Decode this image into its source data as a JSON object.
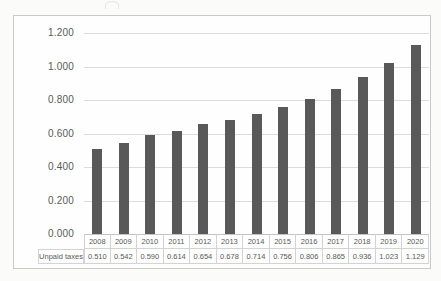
{
  "page": {
    "background_color": "#fbfbf9",
    "frame_border_color": "#c9c9c9"
  },
  "chart_data": {
    "type": "bar",
    "title": "",
    "xlabel": "",
    "ylabel": "",
    "categories": [
      "2008",
      "2009",
      "2010",
      "2011",
      "2012",
      "2013",
      "2014",
      "2015",
      "2016",
      "2017",
      "2018",
      "2019",
      "2020"
    ],
    "series": [
      {
        "name": "Unpaid taxes",
        "values": [
          0.51,
          0.542,
          0.59,
          0.614,
          0.654,
          0.678,
          0.714,
          0.756,
          0.806,
          0.865,
          0.936,
          1.023,
          1.129
        ]
      }
    ],
    "value_decimals": 3,
    "ylim": [
      0,
      1.2
    ],
    "ytick_step": 0.2,
    "ytick_labels": [
      "0.000",
      "0.200",
      "0.400",
      "0.600",
      "0.800",
      "1.000",
      "1.200"
    ],
    "grid": true,
    "legend_position": "data-table-row",
    "bar_color": "#595959",
    "gridline_color": "#dcdcdc",
    "axis_text_color": "#595959",
    "table_border_color": "#d3d3d3"
  }
}
